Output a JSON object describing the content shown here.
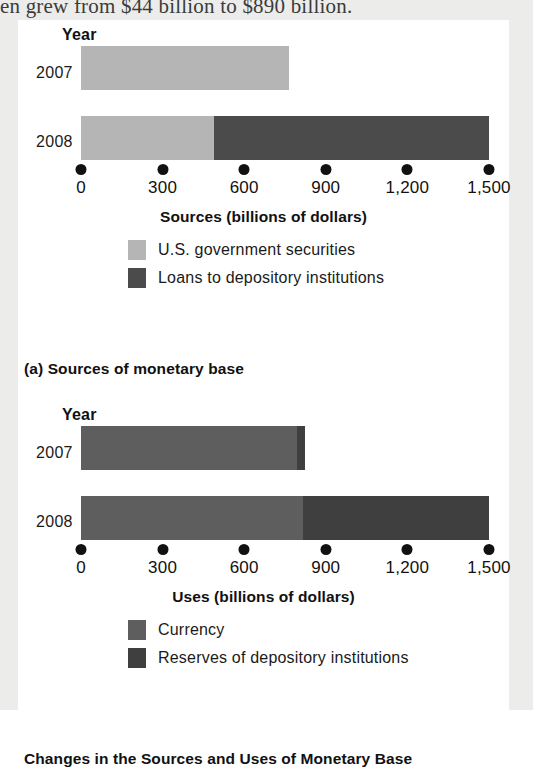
{
  "page": {
    "running_text": "en grew from $44 billion to $890 billion."
  },
  "figure": {
    "title": "Changes in the Sources and Uses of Monetary Base",
    "panels": [
      {
        "id": "a",
        "caption": "(a) Sources of monetary base",
        "year_header": "Year",
        "axis_title": "Sources (billions of dollars)",
        "categories": [
          "2007",
          "2008"
        ],
        "ticks": [
          "0",
          "300",
          "600",
          "900",
          "1,200",
          "1,500"
        ],
        "legend": [
          {
            "label": "U.S. government securities",
            "color": "#b5b5b5"
          },
          {
            "label": "Loans to depository institutions",
            "color": "#4b4b4b"
          }
        ]
      },
      {
        "id": "b",
        "caption": "(b) Uses of monetary base",
        "year_header": "Year",
        "axis_title": "Uses (billions of dollars)",
        "categories": [
          "2007",
          "2008"
        ],
        "ticks": [
          "0",
          "300",
          "600",
          "900",
          "1,200",
          "1,500"
        ],
        "legend": [
          {
            "label": "Currency",
            "color": "#5e5e5e"
          },
          {
            "label": "Reserves of depository institutions",
            "color": "#3f3f3f"
          }
        ]
      }
    ]
  },
  "chart_data": [
    {
      "type": "bar",
      "orientation": "horizontal",
      "stacked": true,
      "title": "(a) Sources of monetary base",
      "xlabel": "Sources (billions of dollars)",
      "ylabel": "Year",
      "xlim": [
        0,
        1500
      ],
      "xticks": [
        0,
        300,
        600,
        900,
        1200,
        1500
      ],
      "xticklabels": [
        "0",
        "300",
        "600",
        "900",
        "1,200",
        "1,500"
      ],
      "grid": false,
      "legend_position": "below-axis-centered",
      "categories": [
        "2007",
        "2008"
      ],
      "series": [
        {
          "name": "U.S. government securities",
          "color": "#b5b5b5",
          "values": [
            765,
            490
          ]
        },
        {
          "name": "Loans to depository institutions",
          "color": "#4b4b4b",
          "values": [
            0,
            1010
          ]
        }
      ],
      "totals": [
        765,
        1500
      ]
    },
    {
      "type": "bar",
      "orientation": "horizontal",
      "stacked": true,
      "title": "(b) Uses of monetary base",
      "xlabel": "Uses (billions of dollars)",
      "ylabel": "Year",
      "xlim": [
        0,
        1500
      ],
      "xticks": [
        0,
        300,
        600,
        900,
        1200,
        1500
      ],
      "xticklabels": [
        "0",
        "300",
        "600",
        "900",
        "1,200",
        "1,500"
      ],
      "grid": false,
      "legend_position": "below-axis-centered",
      "categories": [
        "2007",
        "2008"
      ],
      "series": [
        {
          "name": "Currency",
          "color": "#5e5e5e",
          "values": [
            795,
            815
          ]
        },
        {
          "name": "Reserves of depository institutions",
          "color": "#3f3f3f",
          "values": [
            30,
            685
          ]
        }
      ],
      "totals": [
        825,
        1500
      ]
    }
  ]
}
